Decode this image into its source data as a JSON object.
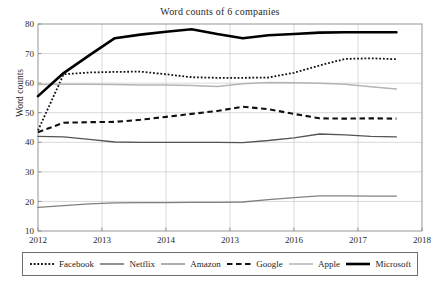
{
  "chart_data": {
    "type": "line",
    "title": "Word counts of 6 companies",
    "xlabel": "",
    "ylabel": "Word counts",
    "xlim": [
      2012,
      2018
    ],
    "ylim": [
      10,
      80
    ],
    "yticks": [
      10,
      20,
      30,
      40,
      50,
      60,
      70,
      80
    ],
    "ytick_labels": [
      "10",
      "20",
      "30",
      "40",
      "50",
      "60",
      "70",
      "80"
    ],
    "xticks": [
      2012,
      2013,
      2014,
      2015,
      2016,
      2017,
      2018
    ],
    "xtick_labels": [
      "2012",
      "2013",
      "2014",
      "2013",
      "2016",
      "2017",
      "2018"
    ],
    "grid": true,
    "legend_position": "below-plot",
    "x": [
      2012.0,
      2012.4,
      2012.8,
      2013.2,
      2013.6,
      2014.0,
      2014.4,
      2014.8,
      2015.2,
      2015.6,
      2016.0,
      2016.4,
      2016.8,
      2017.2,
      2017.6
    ],
    "series": [
      {
        "name": "Facebook",
        "style": "dotted",
        "color": "#111111",
        "width": 1.8,
        "values": [
          44.0,
          63.0,
          63.6,
          63.8,
          63.9,
          63.0,
          62.0,
          61.8,
          61.8,
          61.9,
          63.5,
          66.0,
          68.2,
          68.4,
          68.1
        ]
      },
      {
        "name": "Netflix",
        "style": "solid",
        "color": "#555555",
        "width": 1.3,
        "values": [
          42.0,
          41.8,
          41.0,
          40.1,
          40.0,
          40.0,
          40.0,
          40.0,
          39.9,
          40.6,
          41.5,
          42.8,
          42.5,
          42.0,
          41.8
        ]
      },
      {
        "name": "Amazon",
        "style": "solid",
        "color": "#808080",
        "width": 1.3,
        "values": [
          18.0,
          18.6,
          19.2,
          19.5,
          19.6,
          19.6,
          19.7,
          19.7,
          19.8,
          20.6,
          21.3,
          21.9,
          21.9,
          21.8,
          21.8
        ]
      },
      {
        "name": "Google",
        "style": "dashed",
        "color": "#111111",
        "width": 2.1,
        "values": [
          43.4,
          46.6,
          46.8,
          46.9,
          47.6,
          48.6,
          49.6,
          50.6,
          52.0,
          51.2,
          49.6,
          48.1,
          48.0,
          48.1,
          48.0
        ]
      },
      {
        "name": "Apple",
        "style": "solid",
        "color": "#b4b4b4",
        "width": 1.5,
        "values": [
          59.5,
          59.6,
          59.6,
          59.5,
          59.4,
          59.4,
          59.2,
          58.9,
          59.8,
          60.2,
          60.1,
          60.0,
          59.6,
          58.8,
          58.0
        ]
      },
      {
        "name": "Microsoft",
        "style": "solid",
        "color": "#000000",
        "width": 2.6,
        "values": [
          55.6,
          63.4,
          69.4,
          75.2,
          76.4,
          77.4,
          78.2,
          76.6,
          75.2,
          76.2,
          76.6,
          77.1,
          77.2,
          77.2,
          77.2
        ]
      }
    ]
  },
  "legend": {
    "items": [
      {
        "label": "Facebook"
      },
      {
        "label": "Netflix"
      },
      {
        "label": "Amazon"
      },
      {
        "label": "Google"
      },
      {
        "label": "Apple"
      },
      {
        "label": "Microsoft"
      }
    ]
  },
  "axes": {
    "frame_color": "#8a8a8a",
    "grid_color": "#c8c8c8"
  }
}
